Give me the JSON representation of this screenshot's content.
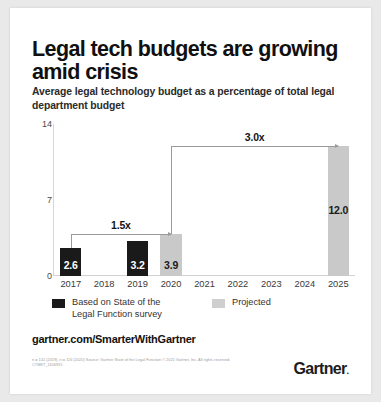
{
  "card": {
    "headline": "Legal tech budgets are growing amid crisis",
    "subhead": "Average legal technology budget as a percentage of total legal department budget",
    "url": "gartner.com/SmarterWithGartner",
    "logo": "Gartner",
    "logo_mark": ".",
    "footnote": "n = 142 (2019), n = 116 (2020)\nSource: Gartner State of the Legal Function\n© 2021 Gartner, Inc. All rights reserved. CTMKT_1106915"
  },
  "legend": {
    "items": [
      {
        "label": "Based on State of the\nLegal Function survey",
        "color": "#1a1a1a",
        "key": "survey"
      },
      {
        "label": "Projected",
        "color": "#cfcfcf",
        "key": "projected"
      }
    ]
  },
  "chart_data": {
    "type": "bar",
    "title": "Legal tech budgets are growing amid crisis",
    "subtitle": "Average legal technology budget as a percentage of total legal department budget",
    "xlabel": "",
    "ylabel": "",
    "ylim": [
      0,
      14
    ],
    "yticks": [
      0,
      7,
      14
    ],
    "grid": false,
    "legend_position": "bottom-left",
    "categories": [
      "2017",
      "2018",
      "2019",
      "2020",
      "2021",
      "2022",
      "2023",
      "2024",
      "2025"
    ],
    "values": [
      2.6,
      null,
      3.2,
      3.9,
      null,
      null,
      null,
      null,
      12.0
    ],
    "point_labels": [
      "2.6",
      "",
      "3.2",
      "3.9",
      "",
      "",
      "",
      "",
      "12.0"
    ],
    "series": [
      {
        "name": "Based on State of the Legal Function survey",
        "color": "#1a1a1a",
        "points": [
          {
            "x": "2017",
            "y": 2.6,
            "label": "2.6"
          },
          {
            "x": "2019",
            "y": 3.2,
            "label": "3.2"
          }
        ]
      },
      {
        "name": "Projected",
        "color": "#c9c9c9",
        "points": [
          {
            "x": "2020",
            "y": 3.9,
            "label": "3.9"
          },
          {
            "x": "2025",
            "y": 12.0,
            "label": "12.0"
          }
        ]
      }
    ],
    "annotations": [
      {
        "label": "1.5x",
        "from": "2017",
        "to": "2020",
        "from_value": 2.6,
        "to_value": 3.9
      },
      {
        "label": "3.0x",
        "from": "2020",
        "to": "2025",
        "from_value": 3.9,
        "to_value": 12.0
      }
    ]
  }
}
